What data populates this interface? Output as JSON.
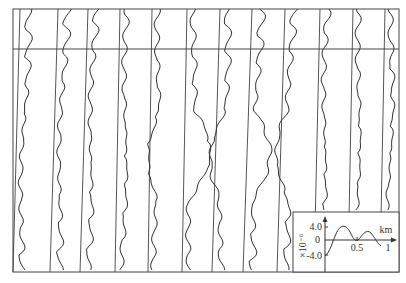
{
  "figure": {
    "type": "stacked-profile-curves",
    "frame": {
      "x": 13,
      "y": 9,
      "width": 386,
      "height": 263
    },
    "horizontal_line_y": 49,
    "baselines": [
      {
        "top_x": 20,
        "bottom_x": 13
      },
      {
        "top_x": 58,
        "bottom_x": 50
      },
      {
        "top_x": 88,
        "bottom_x": 80
      },
      {
        "top_x": 120,
        "bottom_x": 115
      },
      {
        "top_x": 152,
        "bottom_x": 148
      },
      {
        "top_x": 187,
        "bottom_x": 182
      },
      {
        "top_x": 220,
        "bottom_x": 212
      },
      {
        "top_x": 252,
        "bottom_x": 243
      },
      {
        "top_x": 285,
        "bottom_x": 277
      },
      {
        "top_x": 320,
        "bottom_x": 314
      },
      {
        "top_x": 353,
        "bottom_x": 348
      },
      {
        "top_x": 385,
        "bottom_x": 380
      }
    ]
  },
  "inset": {
    "box": {
      "x": 293,
      "y": 212,
      "width": 106,
      "height": 60
    },
    "y_axis": {
      "scale_label": "×10⁻⁶",
      "ticks": [
        "4.0",
        "0",
        "-4.0"
      ],
      "tick_values": [
        4.0,
        0,
        -4.0
      ]
    },
    "x_axis": {
      "unit_label": "km",
      "ticks": [
        "0.5",
        "1"
      ],
      "tick_values": [
        0.5,
        1
      ]
    }
  }
}
